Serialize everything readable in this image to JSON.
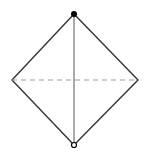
{
  "diagram": {
    "shape": "rhombus",
    "colors": {
      "background": "#ffffff",
      "outline": "#333333",
      "vertical_line": "#555555",
      "dashed_line": "#999999",
      "top_dot": "#000000",
      "bottom_dot_stroke": "#000000"
    },
    "vertices": {
      "top": [
        74,
        14
      ],
      "right": [
        138,
        80
      ],
      "bottom": [
        74,
        145
      ],
      "left": [
        12,
        80
      ]
    },
    "lines": [
      {
        "name": "vertical-diagonal",
        "style": "solid",
        "from": "top",
        "to": "bottom"
      },
      {
        "name": "horizontal-diagonal",
        "style": "dashed",
        "from": "left",
        "to": "right"
      }
    ],
    "markers": [
      {
        "name": "top-vertex-dot",
        "type": "filled-circle",
        "at": "top"
      },
      {
        "name": "bottom-vertex-dot",
        "type": "open-circle",
        "at": "bottom"
      }
    ]
  }
}
